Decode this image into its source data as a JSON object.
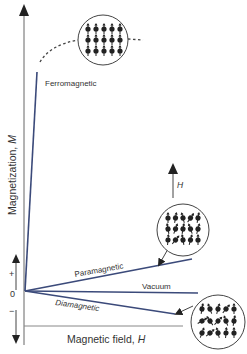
{
  "diagram": {
    "y_axis_label": "Magnetization, ",
    "y_axis_symbol": "M",
    "x_axis_label": "Magnetic field, ",
    "x_axis_symbol": "H",
    "field_arrow_label": "H",
    "origin_label": "0",
    "plus_label": "+",
    "minus_label": "−",
    "curves": [
      {
        "name": "Ferromagnetic",
        "label": "Ferromagnetic"
      },
      {
        "name": "Paramagnetic",
        "label": "Paramagnetic"
      },
      {
        "name": "Vacuum",
        "label": "Vacuum"
      },
      {
        "name": "Diamagnetic",
        "label": "Diamagnetic"
      }
    ],
    "colors": {
      "curve": "#3b4a7a",
      "axis": "#555555",
      "text": "#333333",
      "dipole": "#222222"
    }
  }
}
